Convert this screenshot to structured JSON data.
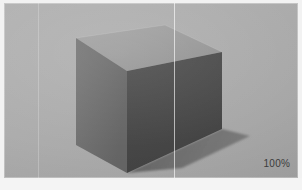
{
  "app": {
    "background_color": "#f2f2f2"
  },
  "viewport": {
    "name": "3d-viewport",
    "background_color": "#adadad",
    "guides": [
      {
        "name": "guide-left",
        "x": 34,
        "color": "#ffffff",
        "opacity": 0.22
      },
      {
        "name": "guide-mid",
        "x": 170,
        "color": "#ffffff",
        "opacity": 0.62
      }
    ],
    "zoom_label": "100%"
  },
  "object": {
    "name": "cube",
    "shape": "cube",
    "faces": {
      "top": {
        "label": "top-face",
        "color": "#9b9b9b",
        "points": "72,35 161,22 218,49 123,68"
      },
      "left": {
        "label": "left-face",
        "color": "#6e6e6e",
        "points": "72,35 123,68 123,170 72,142"
      },
      "right": {
        "label": "right-face",
        "color": "#4a4a4a",
        "points": "123,68 218,49 218,126 123,170"
      }
    },
    "shadow": {
      "label": "cast-shadow",
      "color": "#6f6f6f",
      "points": "123,170 218,126 244,133 176,163"
    }
  },
  "status": {
    "strip_color": "#f4f4f4"
  }
}
